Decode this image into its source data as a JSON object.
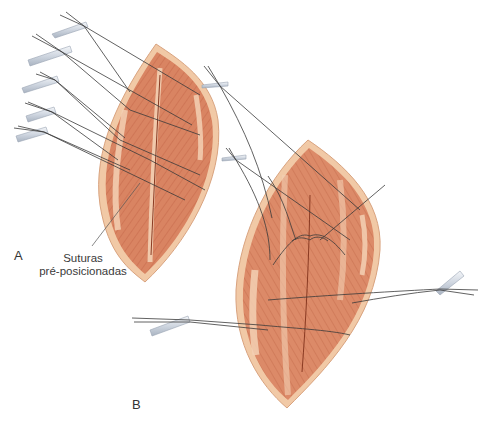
{
  "figure": {
    "panels": [
      {
        "id": "A",
        "label": "A",
        "description": "Elliptical wound with pre-positioned sutures held by clamps"
      },
      {
        "id": "B",
        "label": "B",
        "description": "Larger elliptical wound with sutures tied across muscle bands"
      }
    ],
    "callout": {
      "line1": "Suturas",
      "line2": "pré-posicionadas",
      "points_to": "A"
    },
    "colors": {
      "background": "#ffffff",
      "skin_edge": "#f1c9a6",
      "muscle": "#d98462",
      "muscle_dark": "#b8593b",
      "fascia": "#f3d0b4",
      "suture": "#3a3a3a",
      "clamp": "#d7dde6"
    }
  }
}
